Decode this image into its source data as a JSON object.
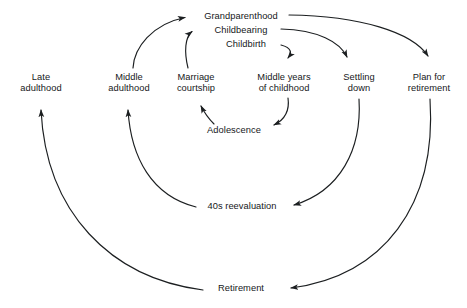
{
  "diagram": {
    "background_color": "#ffffff",
    "line_color": "#1c1f21",
    "text_color": "#16181a",
    "nodes": [
      {
        "id": "late_adulthood",
        "label_line1": "Late",
        "label_line2": "adulthood"
      },
      {
        "id": "middle_adulthood",
        "label_line1": "Middle",
        "label_line2": "adulthood"
      },
      {
        "id": "marriage",
        "label_line1": "Marriage",
        "label_line2": "courtship"
      },
      {
        "id": "middle_years",
        "label_line1": "Middle years",
        "label_line2": "of childhood"
      },
      {
        "id": "settling_down",
        "label_line1": "Settling",
        "label_line2": "down"
      },
      {
        "id": "plan_retirement",
        "label_line1": "Plan for",
        "label_line2": "retirement"
      },
      {
        "id": "grandparenthood",
        "label_line1": "Grandparenthood",
        "label_line2": ""
      },
      {
        "id": "childbearing",
        "label_line1": "Childbearing",
        "label_line2": ""
      },
      {
        "id": "childbirth",
        "label_line1": "Childbirth",
        "label_line2": ""
      },
      {
        "id": "adolescence",
        "label_line1": "Adolescence",
        "label_line2": ""
      },
      {
        "id": "reevaluation_40s",
        "label_line1": "40s reevaluation",
        "label_line2": ""
      },
      {
        "id": "retirement",
        "label_line1": "Retirement",
        "label_line2": ""
      }
    ],
    "edges": [
      {
        "from": "middle_adulthood",
        "to": "grandparenthood"
      },
      {
        "from": "marriage",
        "to": "childbearing"
      },
      {
        "from": "childbirth",
        "to": "middle_years"
      },
      {
        "from": "childbearing",
        "to": "settling_down"
      },
      {
        "from": "grandparenthood",
        "to": "plan_retirement"
      },
      {
        "from": "middle_years",
        "to": "adolescence"
      },
      {
        "from": "adolescence",
        "to": "marriage"
      },
      {
        "from": "settling_down",
        "to": "reevaluation_40s"
      },
      {
        "from": "reevaluation_40s",
        "to": "middle_adulthood"
      },
      {
        "from": "plan_retirement",
        "to": "retirement"
      },
      {
        "from": "retirement",
        "to": "late_adulthood"
      }
    ]
  }
}
